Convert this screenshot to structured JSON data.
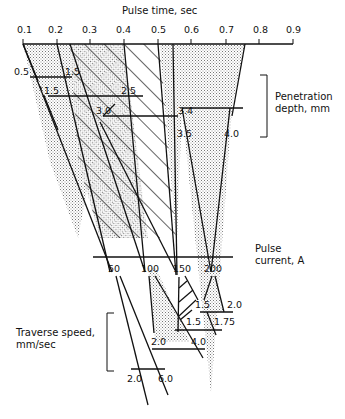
{
  "title": "Pulse time, sec",
  "pulse_time_ticks": [
    "0.1",
    "0.2",
    "0.3",
    "0.4",
    "0.5",
    "0.6",
    "0.7",
    "0.8",
    "0.9"
  ],
  "penetration": {
    "label_line1": "Penetration",
    "label_line2": "depth, mm",
    "values": [
      "0.5",
      "1.5",
      "1.5",
      "2.5",
      "3.0",
      "3.4",
      "3.5",
      "4.0"
    ]
  },
  "pulse_current": {
    "label_line1": "Pulse",
    "label_line2": "current, A",
    "ticks": [
      "50",
      "100",
      "150",
      "200"
    ]
  },
  "traverse_speed": {
    "label_line1": "Traverse speed,",
    "label_line2": "mm/sec",
    "values": [
      "1.5",
      "2.0",
      "1.5",
      "1.75",
      "2.0",
      "4.0",
      "2.0",
      "6.0"
    ]
  }
}
